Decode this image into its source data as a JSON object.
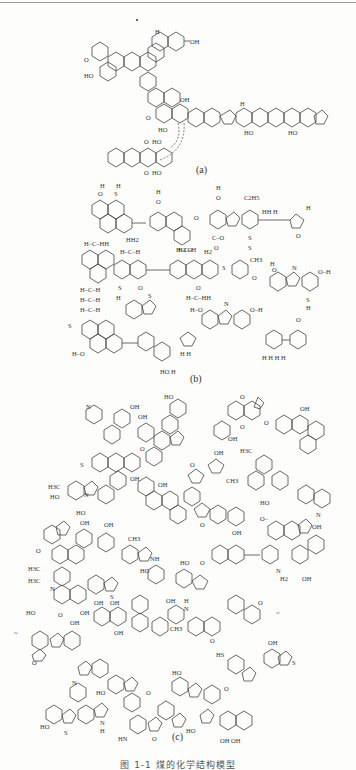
{
  "figure": {
    "panels": [
      {
        "label": "(a)",
        "atom_labels": [
          "H",
          "OH",
          "O",
          "HO",
          "OH",
          "O",
          "HO",
          "H",
          "HO",
          "HO",
          "O",
          "HO",
          "O",
          "HO"
        ]
      },
      {
        "label": "(b)",
        "atom_labels": [
          "H",
          "H",
          "O",
          "S",
          "H",
          "H",
          "H",
          "O",
          "H",
          "O",
          "C2H5",
          "HH",
          "H",
          "S",
          "C",
          "O",
          "H",
          "H",
          "HH2",
          "H2",
          "O",
          "H-C-H",
          "H-C-H",
          "H-C-H",
          "CH3",
          "S",
          "N",
          "H",
          "O",
          "H2",
          "H2",
          "HO",
          "H",
          "S",
          "H"
        ]
      },
      {
        "label": "(c)",
        "atom_labels": [
          "HO",
          "OH",
          "OH",
          "N",
          "O",
          "OH",
          "O",
          "OH",
          "H3C",
          "OH",
          "CH3",
          "HO",
          "N",
          "HO",
          "OH",
          "CH3",
          "NH",
          "H3C",
          "H3C",
          "N",
          "HO",
          "O",
          "OH",
          "OH",
          "OH",
          "HS",
          "OH",
          "S",
          "HO",
          "N",
          "HO",
          "O",
          "HN",
          "HO",
          "OH",
          "OH",
          "S"
        ]
      }
    ],
    "caption": "图 1-1  煤的化学结构模型",
    "marker": "*"
  }
}
